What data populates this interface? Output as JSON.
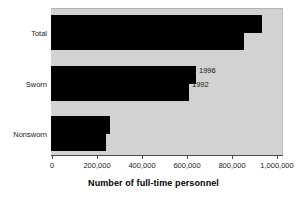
{
  "chart_data": {
    "type": "bar",
    "orientation": "horizontal",
    "title": "",
    "xlabel": "Number of full-time personnel",
    "ylabel": "",
    "xlim": [
      0,
      1000000
    ],
    "grid": false,
    "legend_position": "inline-annotation",
    "categories": [
      "Total",
      "Sworn",
      "Nonsworn"
    ],
    "xticks": [
      0,
      200000,
      400000,
      600000,
      800000,
      1000000
    ],
    "xtick_labels": [
      "0",
      "200,000",
      "400,000",
      "600,000",
      "800,000",
      "1,000,000"
    ],
    "series": [
      {
        "name": "1996",
        "values": [
          933000,
          641000,
          259000
        ]
      },
      {
        "name": "1992",
        "values": [
          853000,
          610000,
          240000
        ]
      }
    ],
    "annotations": [
      {
        "text": "1996",
        "series": "1996"
      },
      {
        "text": "1992",
        "series": "1992"
      }
    ],
    "colors": {
      "bar": "#000000",
      "plot_background": "#d2d2d2",
      "figure_background": "#ffffff",
      "axis": "#4a4a4a",
      "text": "#1a1a1a"
    }
  },
  "axis": {
    "ticks": [
      {
        "label": "0"
      },
      {
        "label": "200,000"
      },
      {
        "label": "400,000"
      },
      {
        "label": "600,000"
      },
      {
        "label": "800,000"
      },
      {
        "label": "1,000,000"
      }
    ],
    "title": "Number of full-time personnel"
  },
  "categories": [
    {
      "label": "Total"
    },
    {
      "label": "Sworn"
    },
    {
      "label": "Nonsworn"
    }
  ],
  "annotations": {
    "upper": "1996",
    "lower": "1992"
  }
}
